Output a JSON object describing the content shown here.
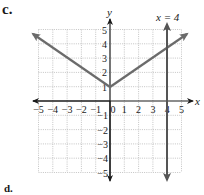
{
  "labels": {
    "part": "c.",
    "next_part": "d."
  },
  "chart_data": {
    "type": "line",
    "title": "",
    "xlabel": "x",
    "ylabel": "y",
    "xlim": [
      -5,
      5
    ],
    "ylim": [
      -5,
      5
    ],
    "grid": true,
    "x_ticks": [
      "−5",
      "−4",
      "−3",
      "−2",
      "−1",
      "0",
      "1",
      "2",
      "3",
      "4",
      "5"
    ],
    "y_ticks_positive": [
      "1",
      "2",
      "3",
      "4",
      "5"
    ],
    "y_ticks_negative": [
      "−1",
      "−2",
      "−3",
      "−4",
      "−5"
    ],
    "series": [
      {
        "name": "absolute value function",
        "description": "V-shaped graph with vertex at (0, 1), arrows on both ends",
        "points": [
          [
            -5.4,
            4.6
          ],
          [
            0,
            1
          ],
          [
            5.4,
            4.6
          ]
        ],
        "color": "#666666"
      },
      {
        "name": "x = 4",
        "description": "vertical line at x = 4, arrows on both ends",
        "points": [
          [
            4,
            5.3
          ],
          [
            4,
            -5.3
          ]
        ],
        "color": "#555555"
      }
    ],
    "annotations": [
      {
        "text": "x = 4",
        "x": 4,
        "y": 5.5
      }
    ]
  },
  "colors": {
    "axis": "#1a1a1a",
    "grid": "#b0b0b0",
    "curve": "#6b6b6b",
    "vertical_line": "#555555"
  }
}
